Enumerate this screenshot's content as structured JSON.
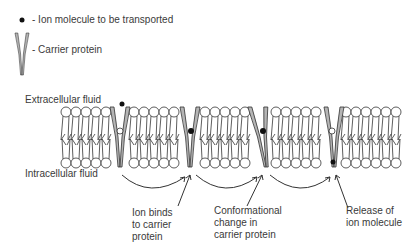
{
  "legend": {
    "ion_label": "- Ion molecule to be transported",
    "carrier_label": "- Carrier protein"
  },
  "regions": {
    "extracellular": "Extracellular fluid",
    "intracellular": "Intracellular fluid"
  },
  "annotations": [
    {
      "lines": [
        "Ion binds",
        "to carrier",
        "protein"
      ]
    },
    {
      "lines": [
        "Conformational",
        "change in",
        "carrier protein"
      ]
    },
    {
      "lines": [
        "Release of",
        "ion molecule"
      ]
    }
  ],
  "colors": {
    "protein_fill": "#b5b5b5",
    "line": "#333333",
    "ion": "#111111"
  }
}
